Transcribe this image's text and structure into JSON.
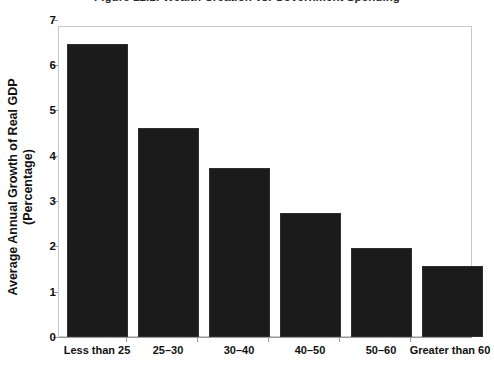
{
  "chart_data": {
    "type": "bar",
    "title": "Figure 12.1: Wealth Creation vs. Government Spending",
    "xlabel": "",
    "ylabel": "Average Annual Growth of Real GDP (Percentage)",
    "ylabel_line1": "Average Annual Growth of Real GDP",
    "ylabel_line2": "(Percentage)",
    "categories": [
      "Less than 25",
      "25–30",
      "30–40",
      "40–50",
      "50–60",
      "Greater than 60"
    ],
    "values": [
      6.6,
      4.7,
      3.8,
      2.8,
      2.0,
      1.6
    ],
    "ylim": [
      0,
      7
    ],
    "yticks": [
      0,
      1,
      2,
      3,
      4,
      5,
      6,
      7
    ],
    "ytick_labels": [
      "0",
      "1",
      "2",
      "3",
      "4",
      "5",
      "6",
      "7"
    ],
    "grid": false,
    "legend": false,
    "legend_position": "none",
    "bar_color": "#1b1b1b",
    "axis_color": "#9a9a9a",
    "background_color": "#ffffff",
    "text_color": "#111111"
  }
}
